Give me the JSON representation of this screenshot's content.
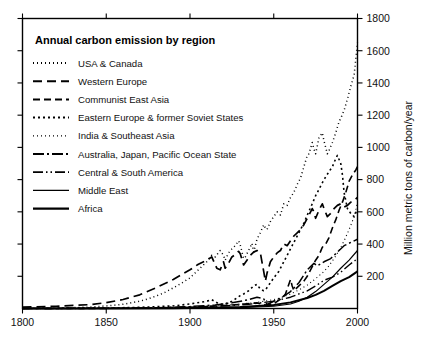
{
  "chart_data": {
    "type": "line",
    "title": "Annual carbon emission by region",
    "xlabel": "",
    "ylabel": "Million metric tons of carbon/year",
    "xlim": [
      1800,
      2000
    ],
    "ylim": [
      0,
      1800
    ],
    "xticks": [
      1800,
      1850,
      1900,
      1950,
      2000
    ],
    "xticklabels": [
      "1800",
      "1850",
      "1900",
      "1950",
      "2000"
    ],
    "yticks": [
      200,
      400,
      600,
      800,
      1000,
      1200,
      1400,
      1600,
      1800
    ],
    "yticklabels": [
      "200",
      "400",
      "600",
      "800",
      "1000",
      "1200",
      "1400",
      "1600",
      "1800"
    ],
    "grid": false,
    "legend_position": "upper-left-inside",
    "series": [
      {
        "name": "USA & Canada",
        "dash": "1,3",
        "width": 1.5,
        "x": [
          1800,
          1810,
          1820,
          1830,
          1840,
          1850,
          1860,
          1870,
          1875,
          1880,
          1885,
          1890,
          1895,
          1900,
          1905,
          1910,
          1913,
          1915,
          1918,
          1920,
          1921,
          1923,
          1925,
          1927,
          1929,
          1930,
          1932,
          1933,
          1935,
          1937,
          1938,
          1940,
          1942,
          1944,
          1945,
          1946,
          1948,
          1950,
          1952,
          1954,
          1956,
          1958,
          1960,
          1962,
          1964,
          1966,
          1968,
          1970,
          1971,
          1973,
          1974,
          1975,
          1977,
          1979,
          1980,
          1982,
          1983,
          1985,
          1987,
          1989,
          1990,
          1992,
          1994,
          1996,
          1998,
          2000
        ],
        "y": [
          1,
          2,
          3,
          5,
          9,
          16,
          26,
          45,
          60,
          78,
          100,
          128,
          158,
          190,
          240,
          290,
          330,
          320,
          360,
          330,
          300,
          345,
          370,
          390,
          420,
          395,
          310,
          320,
          360,
          405,
          350,
          430,
          470,
          520,
          500,
          490,
          540,
          570,
          600,
          580,
          650,
          640,
          690,
          720,
          770,
          810,
          880,
          950,
          960,
          1030,
          990,
          960,
          1060,
          1090,
          1040,
          960,
          980,
          1030,
          1090,
          1160,
          1180,
          1230,
          1300,
          1380,
          1450,
          1650
        ]
      },
      {
        "name": "Western Europe",
        "dash": "9,5",
        "width": 1.7,
        "x": [
          1800,
          1820,
          1840,
          1850,
          1860,
          1870,
          1880,
          1890,
          1900,
          1905,
          1910,
          1913,
          1916,
          1918,
          1920,
          1921,
          1923,
          1925,
          1927,
          1929,
          1930,
          1932,
          1934,
          1936,
          1938,
          1940,
          1942,
          1944,
          1945,
          1946,
          1948,
          1950,
          1952,
          1954,
          1956,
          1958,
          1960,
          1962,
          1964,
          1966,
          1968,
          1970,
          1973,
          1974,
          1975,
          1977,
          1979,
          1980,
          1982,
          1984,
          1986,
          1988,
          1990,
          1992,
          1994,
          1996,
          1998,
          2000
        ],
        "y": [
          8,
          14,
          24,
          36,
          56,
          85,
          130,
          180,
          240,
          275,
          300,
          320,
          250,
          240,
          290,
          250,
          280,
          320,
          335,
          355,
          340,
          270,
          300,
          330,
          350,
          360,
          345,
          230,
          170,
          220,
          290,
          320,
          345,
          360,
          400,
          390,
          420,
          450,
          470,
          490,
          520,
          560,
          620,
          600,
          560,
          610,
          650,
          620,
          570,
          590,
          620,
          640,
          650,
          630,
          640,
          660,
          670,
          690
        ]
      },
      {
        "name": "Communist East Asia",
        "dash": "7,4",
        "width": 1.6,
        "x": [
          1800,
          1850,
          1880,
          1900,
          1910,
          1920,
          1930,
          1940,
          1945,
          1950,
          1953,
          1955,
          1957,
          1958,
          1960,
          1961,
          1962,
          1965,
          1968,
          1970,
          1973,
          1975,
          1977,
          1979,
          1981,
          1983,
          1985,
          1987,
          1989,
          1991,
          1993,
          1995,
          1997,
          1999,
          2000
        ],
        "y": [
          0,
          1,
          3,
          8,
          12,
          18,
          25,
          35,
          22,
          30,
          50,
          65,
          90,
          120,
          180,
          140,
          110,
          140,
          170,
          200,
          260,
          300,
          330,
          380,
          400,
          440,
          500,
          550,
          610,
          660,
          720,
          790,
          830,
          860,
          880
        ]
      },
      {
        "name": "Eastern Europe & former Soviet States",
        "dash": "2,3",
        "width": 1.6,
        "x": [
          1800,
          1850,
          1870,
          1890,
          1900,
          1910,
          1913,
          1917,
          1920,
          1925,
          1928,
          1930,
          1932,
          1935,
          1938,
          1940,
          1942,
          1944,
          1945,
          1948,
          1950,
          1953,
          1955,
          1958,
          1960,
          1963,
          1965,
          1968,
          1970,
          1973,
          1975,
          1978,
          1980,
          1983,
          1985,
          1987,
          1988,
          1990,
          1991,
          1992,
          1994,
          1996,
          1998,
          2000
        ],
        "y": [
          1,
          3,
          7,
          16,
          28,
          45,
          55,
          30,
          25,
          45,
          65,
          80,
          90,
          110,
          140,
          150,
          120,
          110,
          115,
          160,
          190,
          230,
          270,
          330,
          370,
          430,
          470,
          530,
          580,
          650,
          700,
          760,
          800,
          850,
          880,
          930,
          950,
          900,
          830,
          720,
          620,
          590,
          570,
          620
        ]
      },
      {
        "name": "India & Southeast Asia",
        "dash": "1,3",
        "width": 1.1,
        "x": [
          1800,
          1850,
          1880,
          1900,
          1920,
          1930,
          1940,
          1950,
          1955,
          1960,
          1965,
          1970,
          1975,
          1980,
          1983,
          1986,
          1989,
          1992,
          1995,
          1998,
          2000
        ],
        "y": [
          0,
          1,
          4,
          10,
          20,
          28,
          38,
          55,
          70,
          90,
          115,
          145,
          185,
          230,
          265,
          310,
          360,
          420,
          490,
          570,
          660
        ]
      },
      {
        "name": "Australia, Japan, Pacific Ocean State",
        "dash": "11,3,2,3",
        "width": 1.5,
        "x": [
          1800,
          1850,
          1880,
          1900,
          1915,
          1925,
          1935,
          1940,
          1944,
          1946,
          1950,
          1955,
          1960,
          1965,
          1970,
          1974,
          1976,
          1980,
          1984,
          1988,
          1992,
          1996,
          2000
        ],
        "y": [
          0,
          1,
          4,
          12,
          22,
          35,
          55,
          70,
          60,
          25,
          45,
          70,
          105,
          160,
          240,
          280,
          265,
          290,
          310,
          350,
          390,
          410,
          430
        ]
      },
      {
        "name": "Central & South America",
        "dash": "10,3,1.5,3,1.5,3",
        "width": 1.4,
        "x": [
          1800,
          1850,
          1880,
          1900,
          1920,
          1935,
          1950,
          1960,
          1970,
          1975,
          1980,
          1985,
          1990,
          1995,
          2000
        ],
        "y": [
          0,
          1,
          3,
          8,
          16,
          26,
          45,
          70,
          110,
          140,
          175,
          195,
          225,
          270,
          310
        ]
      },
      {
        "name": "Middle East",
        "dash": "none",
        "width": 1.2,
        "x": [
          1800,
          1850,
          1890,
          1910,
          1930,
          1950,
          1960,
          1965,
          1970,
          1975,
          1980,
          1985,
          1990,
          1995,
          2000
        ],
        "y": [
          0,
          0,
          1,
          3,
          6,
          14,
          28,
          45,
          70,
          105,
          150,
          195,
          250,
          300,
          360
        ]
      },
      {
        "name": "Africa",
        "dash": "none",
        "width": 2.0,
        "x": [
          1800,
          1850,
          1890,
          1910,
          1930,
          1950,
          1960,
          1970,
          1975,
          1980,
          1985,
          1990,
          1995,
          2000
        ],
        "y": [
          0,
          0,
          2,
          5,
          10,
          22,
          38,
          65,
          85,
          110,
          140,
          170,
          195,
          230
        ]
      }
    ]
  },
  "legend": {
    "items": [
      {
        "label": "USA & Canada",
        "dash": "1,3",
        "width": 1.8
      },
      {
        "label": "Western Europe",
        "dash": "9,5",
        "width": 2.0
      },
      {
        "label": "Communist East Asia",
        "dash": "7,4",
        "width": 2.0
      },
      {
        "label": "Eastern Europe & former Soviet States",
        "dash": "2,3",
        "width": 2.0
      },
      {
        "label": "India & Southeast Asia",
        "dash": "1,3",
        "width": 1.3
      },
      {
        "label": "Australia, Japan, Pacific Ocean State",
        "dash": "11,3,2,3",
        "width": 1.8
      },
      {
        "label": "Central & South America",
        "dash": "10,3,1.5,3,1.5,3",
        "width": 1.8
      },
      {
        "label": "Middle East",
        "dash": "none",
        "width": 1.3
      },
      {
        "label": "Africa",
        "dash": "none",
        "width": 2.2
      }
    ]
  },
  "colors": {
    "ink": "#000000",
    "background": "#ffffff"
  }
}
